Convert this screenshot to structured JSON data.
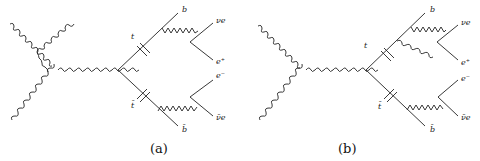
{
  "figure": {
    "panels": [
      {
        "caption": "(a)",
        "labels": {
          "t": "t",
          "tbar": "t̄",
          "b": "b",
          "bbar": "b̄",
          "nu_e": "νe",
          "e_plus": "e⁺",
          "e_minus": "e⁻",
          "nubar_e": "ν̄e"
        }
      },
      {
        "caption": "(b)",
        "labels": {
          "t": "t",
          "tbar": "t̄",
          "b": "b",
          "bbar": "b̄",
          "nu_e": "νe",
          "e_plus": "e⁺",
          "e_minus": "e⁻",
          "nubar_e": "ν̄e"
        }
      }
    ],
    "colors": {
      "line": "#222222",
      "background": "#ffffff"
    }
  }
}
